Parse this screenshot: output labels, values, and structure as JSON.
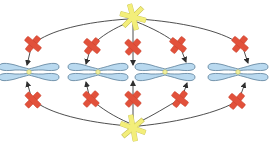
{
  "diagram": {
    "title": "",
    "colors": {
      "star": "#f3ee7a",
      "star_stroke": "#c9c23a",
      "blocker": "#e2513b",
      "blocker_stroke": "#b73b28",
      "chromosome": "#b9d9ef",
      "chromosome_stroke": "#5c7f99",
      "centromere": "#f1f0a0",
      "line": "#3b3b3b",
      "background": "#ffffff"
    },
    "spindle_poles": [
      {
        "id": "top-pole",
        "x": 133,
        "y": 17
      },
      {
        "id": "bottom-pole",
        "x": 133,
        "y": 128
      }
    ],
    "chromosomes": [
      {
        "id": "chromosome-1",
        "centromere_x": 29,
        "y": 72
      },
      {
        "id": "chromosome-2",
        "centromere_x": 98,
        "y": 72
      },
      {
        "id": "chromosome-3",
        "centromere_x": 165,
        "y": 72
      },
      {
        "id": "chromosome-4",
        "centromere_x": 238,
        "y": 72
      }
    ],
    "blockers_top": [
      {
        "x": 33,
        "y": 44
      },
      {
        "x": 92,
        "y": 46
      },
      {
        "x": 133,
        "y": 47
      },
      {
        "x": 178,
        "y": 45
      },
      {
        "x": 240,
        "y": 44
      }
    ],
    "blockers_bottom": [
      {
        "x": 33,
        "y": 100
      },
      {
        "x": 91,
        "y": 99
      },
      {
        "x": 133,
        "y": 99
      },
      {
        "x": 180,
        "y": 99
      },
      {
        "x": 237,
        "y": 101
      }
    ]
  }
}
